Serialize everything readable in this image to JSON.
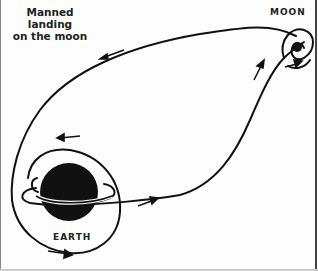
{
  "diagram": {
    "title_line1": "Manned landing",
    "title_line2": "on the moon",
    "labels": {
      "moon": "MOON",
      "earth": "EARTH"
    },
    "colors": {
      "ink": "#111111",
      "background": "#fdfdfd"
    },
    "elements": [
      "earth-body",
      "moon-body",
      "parking-orbit",
      "earth-loop",
      "outbound-trajectory",
      "return-trajectory",
      "lunar-orbit",
      "direction-arrows"
    ]
  }
}
